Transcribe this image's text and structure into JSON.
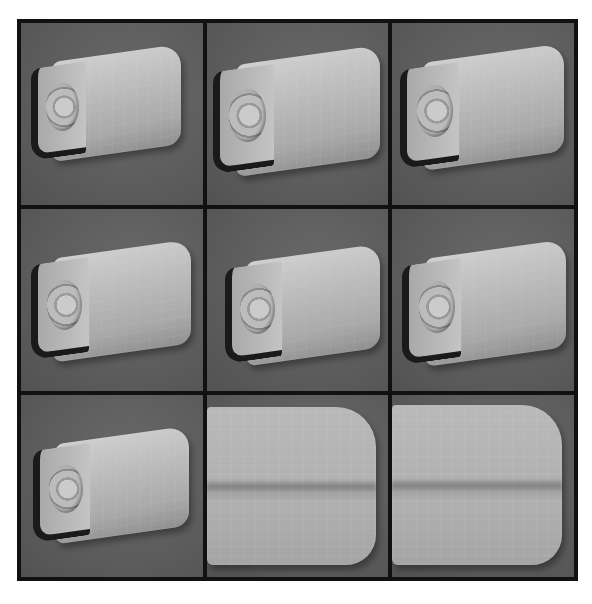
{
  "figure": {
    "panels": [
      {
        "id": 1,
        "view": "camera-housing-render",
        "variant": "full"
      },
      {
        "id": 2,
        "view": "camera-housing-render",
        "variant": "full"
      },
      {
        "id": 3,
        "view": "camera-housing-render",
        "variant": "full"
      },
      {
        "id": 4,
        "view": "camera-housing-render",
        "variant": "full"
      },
      {
        "id": 5,
        "view": "camera-housing-render",
        "variant": "full"
      },
      {
        "id": 6,
        "view": "camera-housing-render",
        "variant": "full"
      },
      {
        "id": 7,
        "view": "camera-housing-render",
        "variant": "full"
      },
      {
        "id": 8,
        "view": "camera-housing-render",
        "variant": "close-up"
      },
      {
        "id": 9,
        "view": "camera-housing-render",
        "variant": "close-up"
      }
    ],
    "caption": ""
  },
  "colors": {
    "background": "#5c5c5c",
    "grid_border": "#111111",
    "model": "#bdbdbd"
  }
}
